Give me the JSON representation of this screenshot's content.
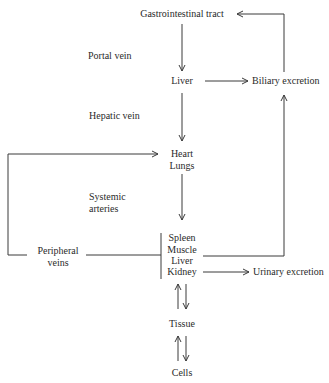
{
  "diagram": {
    "nodes": {
      "gi_tract": "Gastrointestinal tract",
      "liver_top": "Liver",
      "biliary": "Biliary excretion",
      "heart": "Heart",
      "lungs": "Lungs",
      "organs": [
        "Spleen",
        "Muscle",
        "Liver",
        "Kidney"
      ],
      "urinary": "Urinary excretion",
      "tissue": "Tissue",
      "cells": "Cells"
    },
    "edge_labels": {
      "portal_vein": "Portal vein",
      "hepatic_vein": "Hepatic vein",
      "systemic_arteries_1": "Systemic",
      "systemic_arteries_2": "arteries",
      "peripheral_veins_1": "Peripheral",
      "peripheral_veins_2": "veins"
    },
    "edges": [
      {
        "from": "Gastrointestinal tract",
        "to": "Liver",
        "label": "Portal vein"
      },
      {
        "from": "Liver",
        "to": "Biliary excretion"
      },
      {
        "from": "Biliary excretion",
        "to": "Gastrointestinal tract"
      },
      {
        "from": "Liver",
        "to": "Heart/Lungs",
        "label": "Hepatic vein"
      },
      {
        "from": "Heart/Lungs",
        "to": "Spleen/Muscle/Liver/Kidney",
        "label": "Systemic arteries"
      },
      {
        "from": "Spleen/Muscle/Liver/Kidney",
        "to": "Heart/Lungs",
        "label": "Peripheral veins"
      },
      {
        "from": "Spleen/Muscle/Liver/Kidney",
        "to": "Biliary excretion"
      },
      {
        "from": "Kidney",
        "to": "Urinary excretion"
      },
      {
        "from": "Spleen/Muscle/Liver/Kidney",
        "to": "Tissue",
        "bidirectional": true
      },
      {
        "from": "Tissue",
        "to": "Cells",
        "bidirectional": true
      }
    ]
  }
}
